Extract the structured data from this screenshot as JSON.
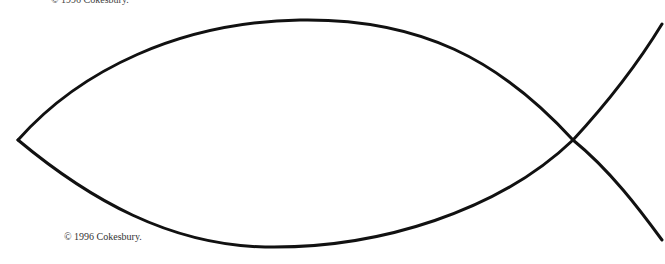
{
  "page": {
    "copyright_top": "© 1996 Cokesbury.",
    "copyright_bottom": "© 1996 Cokesbury."
  },
  "drawing": {
    "subject": "ichthys-fish-outline",
    "stroke_color": "#111111",
    "background": "#ffffff"
  }
}
